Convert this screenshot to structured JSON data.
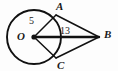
{
  "figure": {
    "kind": "circle-tangent-geometry-diagram",
    "background_color": "#fdfdfd",
    "stroke_color": "#111111",
    "canvas": {
      "width": 118,
      "height": 71
    }
  },
  "circle": {
    "name": "circle-O",
    "center_x": 34,
    "center_y": 37,
    "radius": 27,
    "stroke_width": 1.9
  },
  "points": {
    "O": {
      "label": "O",
      "x": 34,
      "y": 37,
      "dot": true,
      "dot_radius": 2.6
    },
    "A": {
      "label": "A",
      "x": 56,
      "y": 15,
      "dot": false
    },
    "B": {
      "label": "B",
      "x": 99,
      "y": 37,
      "dot": false
    },
    "C": {
      "label": "C",
      "x": 56,
      "y": 58,
      "dot": false
    }
  },
  "segments": [
    {
      "name": "segment-OA",
      "from": "O",
      "to": "A",
      "x1": 34,
      "y1": 37,
      "x2": 56,
      "y2": 15,
      "stroke_width": 1.5
    },
    {
      "name": "segment-OC",
      "from": "O",
      "to": "C",
      "x1": 34,
      "y1": 37,
      "x2": 56,
      "y2": 58,
      "stroke_width": 1.5
    },
    {
      "name": "segment-OB",
      "from": "O",
      "to": "B",
      "x1": 34,
      "y1": 37,
      "x2": 99,
      "y2": 37,
      "stroke_width": 2.4
    },
    {
      "name": "segment-AB",
      "from": "A",
      "to": "B",
      "x1": 56,
      "y1": 15,
      "x2": 99,
      "y2": 37,
      "stroke_width": 1.5
    },
    {
      "name": "segment-CB",
      "from": "C",
      "to": "B",
      "x1": 56,
      "y1": 58,
      "x2": 99,
      "y2": 37,
      "stroke_width": 1.5
    }
  ],
  "measures": {
    "radius_label": "5",
    "hypotenuse_label": "13"
  },
  "labels": {
    "point_a": "A",
    "point_b": "B",
    "point_c": "C",
    "point_o": "O"
  }
}
